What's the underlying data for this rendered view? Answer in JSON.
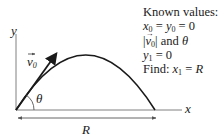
{
  "diagram": {
    "axes": {
      "y_label": "y",
      "x_label": "x"
    },
    "velocity_vector": {
      "label": "v",
      "subscript": "0"
    },
    "angle_label": "θ",
    "range_label": "R",
    "colors": {
      "stroke": "#1a1a1a",
      "axis": "#808080",
      "background": "#ffffff"
    }
  },
  "known_values": {
    "heading": "Known values:",
    "lines": [
      {
        "a": "x",
        "a_sub": "0",
        "mid": " = ",
        "b": "y",
        "b_sub": "0",
        "end": " = 0"
      },
      {
        "prefix": "|",
        "v": "v",
        "v_sub": "0",
        "suffix": "| and ",
        "theta": "θ"
      },
      {
        "a": "y",
        "a_sub": "1",
        "end": " = 0"
      },
      {
        "find": "Find: ",
        "a": "x",
        "a_sub": "1",
        "mid": " = ",
        "b": "R"
      }
    ]
  }
}
